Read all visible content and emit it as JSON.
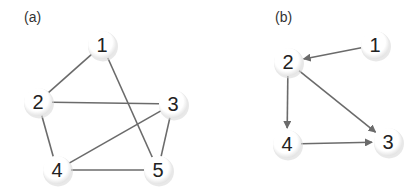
{
  "panels": [
    {
      "label": "(a)",
      "directed": false,
      "nodes": [
        {
          "id": "1",
          "label": "1",
          "x": 102,
          "y": 45
        },
        {
          "id": "2",
          "label": "2",
          "x": 38,
          "y": 102
        },
        {
          "id": "3",
          "label": "3",
          "x": 173,
          "y": 104
        },
        {
          "id": "4",
          "label": "4",
          "x": 57,
          "y": 170
        },
        {
          "id": "5",
          "label": "5",
          "x": 158,
          "y": 170
        }
      ],
      "edges": [
        {
          "from": "1",
          "to": "2"
        },
        {
          "from": "1",
          "to": "5"
        },
        {
          "from": "2",
          "to": "3"
        },
        {
          "from": "2",
          "to": "4"
        },
        {
          "from": "3",
          "to": "4"
        },
        {
          "from": "3",
          "to": "5"
        },
        {
          "from": "4",
          "to": "5"
        }
      ]
    },
    {
      "label": "(b)",
      "directed": true,
      "nodes": [
        {
          "id": "1",
          "label": "1",
          "x": 375,
          "y": 45
        },
        {
          "id": "2",
          "label": "2",
          "x": 288,
          "y": 62
        },
        {
          "id": "3",
          "label": "3",
          "x": 388,
          "y": 142
        },
        {
          "id": "4",
          "label": "4",
          "x": 287,
          "y": 144
        }
      ],
      "edges": [
        {
          "from": "1",
          "to": "2"
        },
        {
          "from": "2",
          "to": "4"
        },
        {
          "from": "2",
          "to": "3"
        },
        {
          "from": "4",
          "to": "3"
        }
      ]
    }
  ],
  "colors": {
    "edge": "#6b6b6b",
    "node_fill": "#ffffff",
    "node_shadow": "#d8d8d8",
    "label": "#222222"
  }
}
